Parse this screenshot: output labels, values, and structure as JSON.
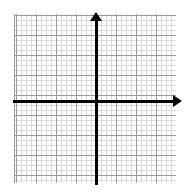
{
  "figure": {
    "kind": "coordinate-plane",
    "width": 185,
    "height": 195,
    "background_color": "#ffffff"
  },
  "grid": {
    "major_line_color": "#9a9a9a",
    "minor_line_color": "#d9d9d9",
    "major_spacing_px": 20,
    "minor_spacing_px": 5,
    "left_px": 14,
    "top_px": 14,
    "width_px": 162,
    "height_px": 169
  },
  "axes": {
    "color": "#000000",
    "thickness_px": 3,
    "origin": {
      "x_px": 96,
      "y_px": 101
    },
    "x_axis": {
      "name": "x-axis",
      "label": "",
      "arrowhead": "right",
      "start_px": 13,
      "end_px": 182
    },
    "y_axis": {
      "name": "y-axis",
      "label": "",
      "arrowhead": "up",
      "start_px": 12,
      "end_px": 185
    }
  },
  "tick_labels": {
    "x": [],
    "y": []
  },
  "annotations": [],
  "plotted_data": []
}
